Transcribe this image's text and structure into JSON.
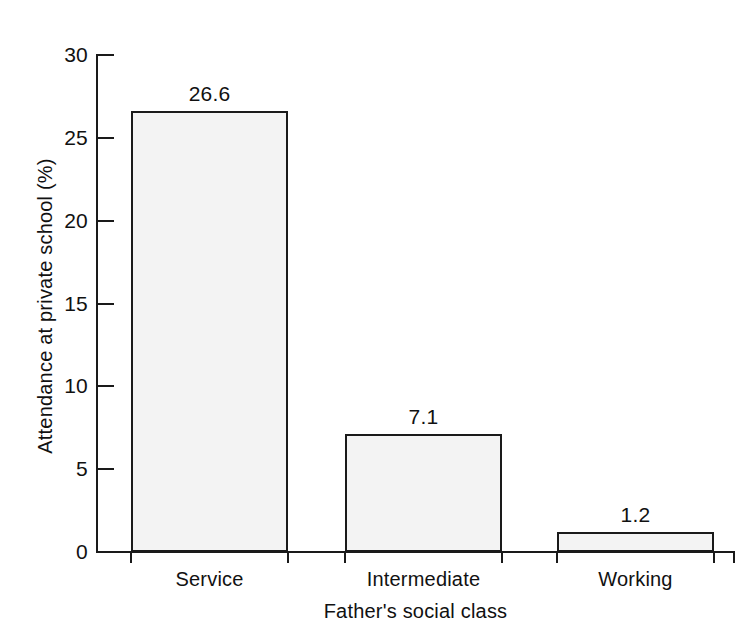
{
  "chart_data": {
    "type": "bar",
    "title": "",
    "categories": [
      "Service",
      "Intermediate",
      "Working"
    ],
    "values": [
      26.6,
      7.1,
      1.2
    ],
    "value_labels": [
      "26.6",
      "7.1",
      "1.2"
    ],
    "xlabel": "Father's social class",
    "ylabel": "Attendance at private school (%)",
    "ylim": [
      0,
      30
    ],
    "yticks": [
      0,
      5,
      10,
      15,
      20,
      25,
      30
    ],
    "ytick_labels": [
      "0",
      "5",
      "10",
      "15",
      "20",
      "25",
      "30"
    ],
    "grid": false,
    "legend": false,
    "bar_fill_color": "#f3f3f3",
    "bar_edge_color": "#1a1a1a",
    "axis_color": "#1a1a1a",
    "background_color": "#ffffff"
  }
}
